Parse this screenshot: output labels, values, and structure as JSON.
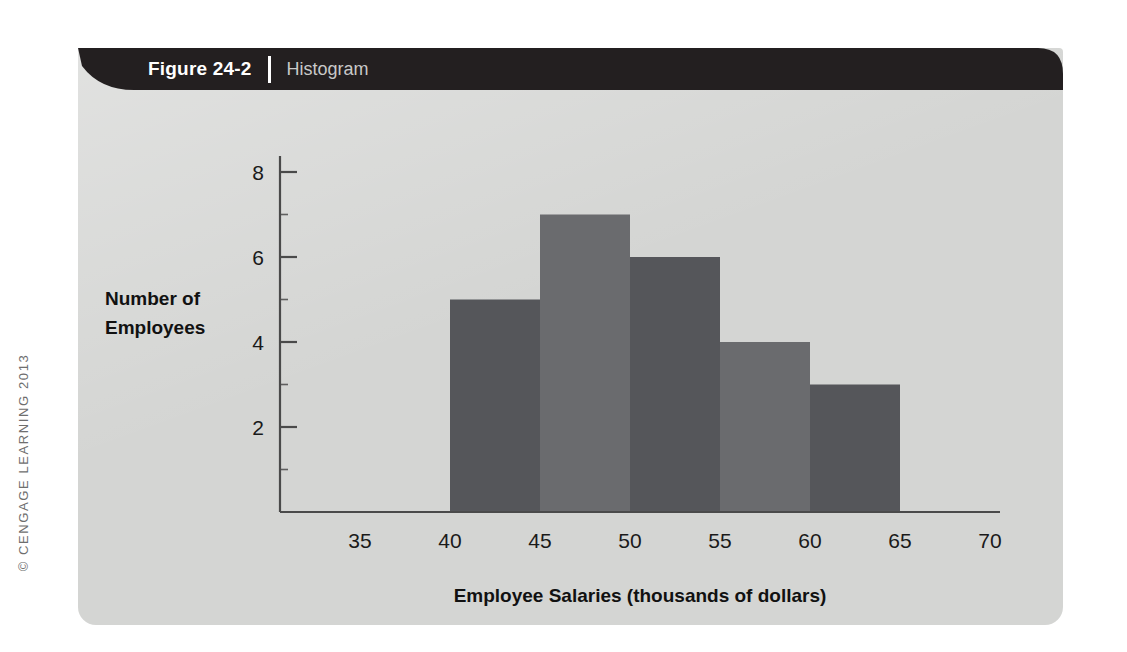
{
  "figure": {
    "number_label": "Figure 24-2",
    "caption": "Histogram",
    "copyright": "© CENGAGE LEARNING 2013"
  },
  "colors": {
    "panel_background": "#d4d5d3",
    "header_bar": "#231f20",
    "bar_dark": "#55565a",
    "bar_medium": "#6a6b6e",
    "axis_line": "#4a4a4a",
    "text": "#1a1a1a",
    "caption_text": "#c9c9c9"
  },
  "chart_data": {
    "type": "bar",
    "title": "Histogram",
    "xlabel": "Employee Salaries (thousands of dollars)",
    "ylabel": "Number of Employees",
    "xlim": [
      32,
      74
    ],
    "ylim": [
      0,
      9
    ],
    "grid": false,
    "legend": null,
    "bin_width": 5,
    "categories": [
      "40-45",
      "45-50",
      "50-55",
      "55-60",
      "60-65"
    ],
    "bin_edges": [
      40,
      45,
      50,
      55,
      60,
      65
    ],
    "values": [
      5,
      7,
      6,
      4,
      3
    ],
    "bar_colors": [
      "#55565a",
      "#6a6b6e",
      "#55565a",
      "#6a6b6e",
      "#55565a"
    ],
    "xticks": [
      35,
      40,
      45,
      50,
      55,
      60,
      65,
      70
    ],
    "xtick_labels": [
      "35",
      "40",
      "45",
      "50",
      "55",
      "60",
      "65",
      "70"
    ],
    "yticks": [
      2,
      4,
      6,
      8
    ],
    "ytick_labels": [
      "2",
      "4",
      "6",
      "8"
    ],
    "y_minor_ticks": [
      1,
      3,
      5,
      7
    ],
    "ylabel_lines": [
      "Number of",
      "Employees"
    ]
  }
}
